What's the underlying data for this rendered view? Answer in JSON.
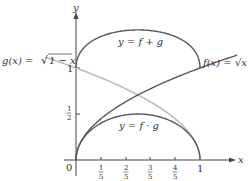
{
  "chart_data": {
    "type": "line",
    "title": "",
    "xlabel": "x",
    "ylabel": "y",
    "xlim": [
      0,
      1.12
    ],
    "ylim": [
      0,
      1.55
    ],
    "x_ticks": [
      "0",
      "1/5",
      "2/5",
      "3/5",
      "4/5",
      "1"
    ],
    "y_ticks": [
      "1/2",
      "1"
    ],
    "grid": false,
    "series": [
      {
        "name": "f(x) = √x",
        "label": "f(x) = √x",
        "expr": "sqrt(x)",
        "domain": [
          0,
          1.3
        ],
        "color": "#555555",
        "points": [
          [
            0,
            0
          ],
          [
            0.2,
            0.447
          ],
          [
            0.4,
            0.632
          ],
          [
            0.6,
            0.775
          ],
          [
            0.8,
            0.894
          ],
          [
            1,
            1
          ]
        ]
      },
      {
        "name": "g(x) = √(1 − x)",
        "label": "g(x) = √1 − x",
        "expr": "sqrt(1-x)",
        "domain": [
          -0.25,
          1
        ],
        "color": "#b8b8b8",
        "points": [
          [
            0,
            1
          ],
          [
            0.2,
            0.894
          ],
          [
            0.4,
            0.775
          ],
          [
            0.6,
            0.632
          ],
          [
            0.8,
            0.447
          ],
          [
            1,
            0
          ]
        ]
      },
      {
        "name": "y = f + g",
        "label": "y = f + g",
        "expr": "sqrt(x)+sqrt(1-x)",
        "domain": [
          0,
          1
        ],
        "color": "#555555",
        "points": [
          [
            0,
            1
          ],
          [
            0.2,
            1.341
          ],
          [
            0.4,
            1.407
          ],
          [
            0.5,
            1.414
          ],
          [
            0.6,
            1.407
          ],
          [
            0.8,
            1.341
          ],
          [
            1,
            1
          ]
        ]
      },
      {
        "name": "y = f · g",
        "label": "y = f · g",
        "expr": "sqrt(x)*sqrt(1-x)",
        "domain": [
          0,
          1
        ],
        "color": "#555555",
        "points": [
          [
            0,
            0
          ],
          [
            0.2,
            0.4
          ],
          [
            0.4,
            0.49
          ],
          [
            0.5,
            0.5
          ],
          [
            0.6,
            0.49
          ],
          [
            0.8,
            0.4
          ],
          [
            1,
            0
          ]
        ]
      }
    ]
  },
  "labels": {
    "y_axis": "y",
    "x_axis": "x",
    "origin": "0",
    "one_x": "1",
    "one_y": "1",
    "half_num": "1",
    "half_den": "2",
    "fifth_num": "1",
    "two_fifths_num": "2",
    "three_fifths_num": "3",
    "four_fifths_num": "4",
    "fifth_den": "5",
    "f_label": "f(x) = √x",
    "g_label_prefix": "g(x) = ",
    "g_label_radicand": "1 − x",
    "sum_label": "y = f + g",
    "prod_label": "y = f · g"
  },
  "colors": {
    "axis": "#444444",
    "dark_curve": "#5a5a5a",
    "light_curve": "#bcbcbc"
  }
}
